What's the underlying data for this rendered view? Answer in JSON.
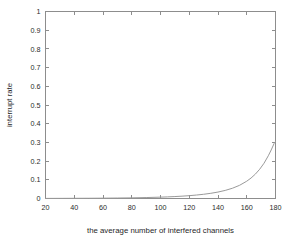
{
  "chart_data": {
    "type": "line",
    "title": "",
    "xlabel": "the average number of interfered channels",
    "ylabel": "interrupt rate",
    "xlim": [
      20,
      180
    ],
    "ylim": [
      0,
      1
    ],
    "grid": false,
    "legend": null,
    "xticks": [
      20,
      40,
      60,
      80,
      100,
      120,
      140,
      160,
      180
    ],
    "xtick_labels": [
      "20",
      "40",
      "60",
      "80",
      "100",
      "120",
      "140",
      "160",
      "180"
    ],
    "yticks": [
      0,
      0.1,
      0.2,
      0.3,
      0.4,
      0.5,
      0.6,
      0.7,
      0.8,
      0.9,
      1
    ],
    "ytick_labels": [
      "0",
      "0.1",
      "0.2",
      "0.3",
      "0.4",
      "0.5",
      "0.6",
      "0.7",
      "0.8",
      "0.9",
      "1"
    ],
    "series": [
      {
        "name": "interrupt rate",
        "color": "#9a9a9a",
        "x": [
          20,
          30,
          40,
          50,
          60,
          70,
          80,
          90,
          100,
          105,
          110,
          115,
          120,
          125,
          130,
          135,
          140,
          145,
          150,
          155,
          160,
          163,
          166,
          169,
          172,
          175,
          177,
          179,
          180
        ],
        "y": [
          0.0005,
          0.0007,
          0.001,
          0.0013,
          0.0018,
          0.0025,
          0.0035,
          0.005,
          0.0072,
          0.0086,
          0.0104,
          0.0125,
          0.0152,
          0.0185,
          0.0226,
          0.0278,
          0.0345,
          0.0432,
          0.0548,
          0.0705,
          0.0925,
          0.1095,
          0.1305,
          0.1565,
          0.1885,
          0.2285,
          0.2595,
          0.2935,
          0.305
        ]
      }
    ]
  },
  "figure": {
    "background_color": "#ffffff",
    "axis_color": "#8d8d8d",
    "text_color": "#2b2b2b"
  }
}
